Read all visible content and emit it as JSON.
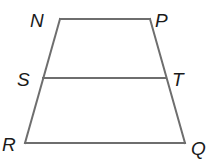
{
  "diagram": {
    "type": "trapezoid-with-midsegment",
    "stroke_color": "#6e6e6e",
    "label_color": "#1a1a1a",
    "vertices": [
      {
        "id": "N",
        "label": "N",
        "x": 60,
        "y": 19,
        "lx": 30,
        "ly": 27
      },
      {
        "id": "P",
        "label": "P",
        "x": 150,
        "y": 19,
        "lx": 155,
        "ly": 27
      },
      {
        "id": "S",
        "label": "S",
        "x": 43,
        "y": 78,
        "lx": 17,
        "ly": 86
      },
      {
        "id": "T",
        "label": "T",
        "x": 166,
        "y": 78,
        "lx": 172,
        "ly": 86
      },
      {
        "id": "R",
        "label": "R",
        "x": 25,
        "y": 143,
        "lx": 2,
        "ly": 151
      },
      {
        "id": "Q",
        "label": "Q",
        "x": 185,
        "y": 143,
        "lx": 191,
        "ly": 155
      }
    ],
    "segments": [
      {
        "from": "N",
        "to": "P"
      },
      {
        "from": "P",
        "to": "Q"
      },
      {
        "from": "Q",
        "to": "R"
      },
      {
        "from": "R",
        "to": "N"
      },
      {
        "from": "S",
        "to": "T"
      }
    ]
  }
}
